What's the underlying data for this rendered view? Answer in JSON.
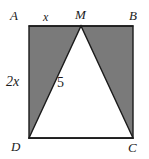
{
  "figure": {
    "type": "geometry-diagram",
    "colors": {
      "background": "#ffffff",
      "shaded_fill": "#7a7a7a",
      "triangle_fill": "#ffffff",
      "stroke": "#1b1b1b",
      "label_text": "#1b1b1b"
    },
    "square": {
      "name": "ABCD",
      "corners": {
        "A": {
          "x": 29,
          "y": 26
        },
        "B": {
          "x": 133,
          "y": 26
        },
        "C": {
          "x": 133,
          "y": 138
        },
        "D": {
          "x": 29,
          "y": 138
        }
      }
    },
    "triangle": {
      "name": "DMC",
      "vertices": {
        "D": {
          "x": 29,
          "y": 138
        },
        "M": {
          "x": 81,
          "y": 26
        },
        "C": {
          "x": 133,
          "y": 138
        }
      }
    },
    "vertex_labels": [
      {
        "id": "A",
        "text": "A"
      },
      {
        "id": "M",
        "text": "M"
      },
      {
        "id": "B",
        "text": "B"
      },
      {
        "id": "D",
        "text": "D"
      },
      {
        "id": "C",
        "text": "C"
      }
    ],
    "measure_labels": [
      {
        "id": "AM",
        "text": "x",
        "side": "top-left-segment"
      },
      {
        "id": "AD",
        "text": "2x",
        "side": "left"
      },
      {
        "id": "interior",
        "text": "5",
        "side": "inside-triangle"
      }
    ]
  }
}
